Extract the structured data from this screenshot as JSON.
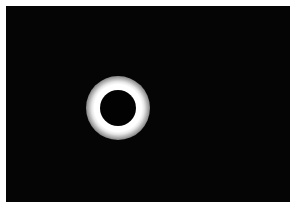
{
  "image": {
    "subject": "Total solar eclipse",
    "description": "Black moon disk surrounded by bright white corona glow against a black sky",
    "colors": {
      "frame": "#ffffff",
      "sky": "#050505",
      "moon": "#020202",
      "corona": "#ffffff"
    },
    "eclipse": {
      "center_x": 118,
      "center_y": 108,
      "moon_radius": 18,
      "corona_radius": 32
    }
  }
}
